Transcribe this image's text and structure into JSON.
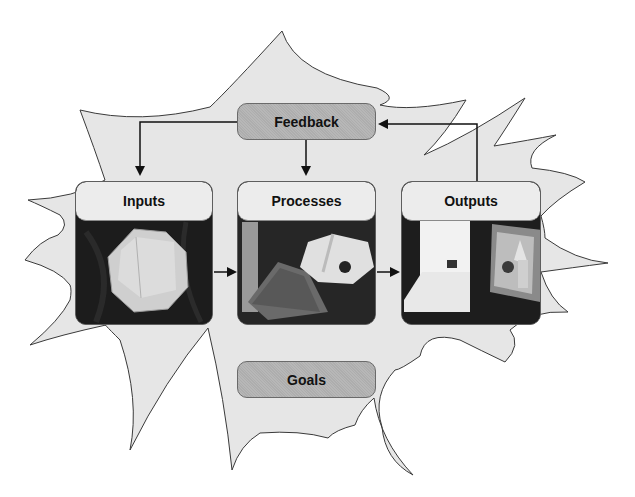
{
  "diagram": {
    "type": "systems-model",
    "nodes": {
      "feedback": {
        "label": "Feedback"
      },
      "inputs": {
        "label": "Inputs",
        "image": "folded-paper-octagon-photo"
      },
      "processes": {
        "label": "Processes",
        "image": "cardboard-model-construction-photo"
      },
      "outputs": {
        "label": "Outputs",
        "image": "finished-cardboard-models-photo"
      },
      "goals": {
        "label": "Goals"
      }
    },
    "edges": [
      {
        "from": "feedback",
        "to": "inputs"
      },
      {
        "from": "feedback",
        "to": "processes"
      },
      {
        "from": "outputs",
        "to": "feedback"
      },
      {
        "from": "inputs",
        "to": "processes"
      },
      {
        "from": "processes",
        "to": "outputs"
      }
    ],
    "background_shape": "spiky-burst",
    "colors": {
      "burst_fill": "#e6e6e6",
      "burst_stroke": "#3a3a3a",
      "pill_fill": "#b3b3b3",
      "card_header_fill": "#ececec",
      "arrow": "#111111"
    }
  }
}
